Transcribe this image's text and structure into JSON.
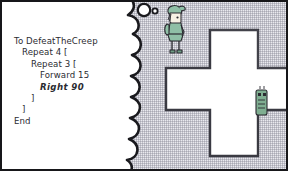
{
  "panel": {
    "name": "comic-panel",
    "background_color": "#e9e9ee",
    "border_color": "#17171a",
    "width": 288,
    "height": 171
  },
  "thought_bubble": {
    "name": "thought-bubble",
    "fill_color": "#ffffff",
    "outline_color": "#1a1a1e",
    "trail_bubbles": 2
  },
  "code": {
    "title": "Logo procedure",
    "lines": [
      {
        "text": "To DefeatTheCreep",
        "indent": 0,
        "emphasis": false
      },
      {
        "text": "Repeat 4 [",
        "indent": 1,
        "emphasis": false
      },
      {
        "text": "Repeat 3 [",
        "indent": 2,
        "emphasis": false
      },
      {
        "text": "Forward 15",
        "indent": 3,
        "emphasis": false
      },
      {
        "text": "Right 90",
        "indent": 3,
        "emphasis": true
      },
      {
        "text": "]",
        "indent": 2,
        "emphasis": false
      },
      {
        "text": "]",
        "indent": 1,
        "emphasis": false
      },
      {
        "text": "End",
        "indent": 0,
        "emphasis": false
      }
    ],
    "text_color": "#2b2b31"
  },
  "hero": {
    "name": "hero-character",
    "tunic_color": "#8fbfa6",
    "outline_color": "#2b2b31",
    "skin_color": "#f6f1e4"
  },
  "creep": {
    "name": "creep-character",
    "body_color": "#7fae91",
    "outline_color": "#2b2b31"
  },
  "music_note": {
    "name": "music-note",
    "color": "#2b2b31",
    "glyph": "eighth-note"
  },
  "path_shape": {
    "name": "cross-path",
    "shape": "plus-cross",
    "fill_color": "#ffffff",
    "outline_color": "#3a3a42"
  }
}
